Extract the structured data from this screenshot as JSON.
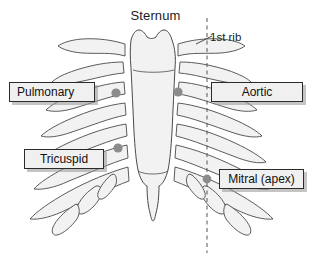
{
  "figure": {
    "title": "Sternum",
    "rib_annotation": "1st rib",
    "width": 311,
    "height": 257
  },
  "callouts": [
    {
      "id": "pulmonary",
      "label": "Pulmonary",
      "side": "left"
    },
    {
      "id": "aortic",
      "label": "Aortic",
      "side": "right"
    },
    {
      "id": "tricuspid",
      "label": "Tricuspid",
      "side": "left"
    },
    {
      "id": "mitral",
      "label": "Mitral (apex)",
      "side": "right"
    }
  ],
  "markers": [
    {
      "id": "pulmonary-point",
      "x": 116,
      "y": 93
    },
    {
      "id": "aortic-point",
      "x": 178,
      "y": 92
    },
    {
      "id": "tricuspid-point",
      "x": 118,
      "y": 148
    },
    {
      "id": "mitral-point",
      "x": 207,
      "y": 179
    }
  ],
  "midclavicular_line": {
    "x": 207,
    "y_start": 18,
    "y_end": 253,
    "style": "dashed"
  },
  "colors": {
    "bone_fill": "#f2f2f2",
    "bone_stroke": "#4a4a4a",
    "marker": "#8c8c8c",
    "callout_fill": "#f0f0f0",
    "callout_border": "#2b2b2b",
    "callout_shadow": "#969696",
    "text": "#111111",
    "background": "#ffffff"
  }
}
